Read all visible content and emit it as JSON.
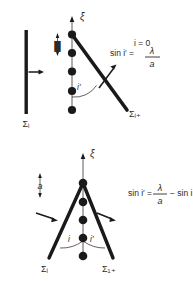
{
  "figure": {
    "background_color": "#ffffff",
    "ink_color": "#1a1a1a",
    "text_color": "#2b2b2b",
    "panels": [
      {
        "id": "top-panel",
        "name": "normal-incidence-grating-diagram",
        "axis_label": "ξ",
        "spacing_label": "a",
        "angle_labels": [
          "i′"
        ],
        "surface_labels": {
          "incident": "Σᵢ",
          "diffracted": "Σᵢ₊"
        },
        "equation_lines": [
          "i = 0",
          "sin i′ =",
          "λ",
          "a"
        ],
        "dot_count": 5
      },
      {
        "id": "bottom-panel",
        "name": "oblique-incidence-grating-diagram",
        "axis_label": "ξ",
        "spacing_label": "a",
        "angle_labels": [
          "i",
          "i′"
        ],
        "surface_labels": {
          "incident": "Σᵢ",
          "diffracted": "Σ₁₊"
        },
        "equation_lines": [
          "sin i′ =",
          "λ",
          "a",
          "− sin i"
        ],
        "dot_count": 5
      }
    ],
    "left_plate": {
      "name": "incident-wavefront-plate",
      "label": "Σᵢ"
    }
  }
}
